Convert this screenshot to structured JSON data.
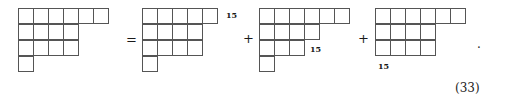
{
  "equation": {
    "number": "(33)",
    "terminal_punctuation": ".",
    "relation_symbol": "=",
    "plus_symbol_1": "+",
    "plus_symbol_2": "+",
    "added_cell_label_1": "15",
    "added_cell_label_2": "15",
    "added_cell_label_3": "15"
  },
  "diagrams": [
    {
      "name": "left-hand-side-diagram",
      "partition": [
        6,
        4,
        4,
        1
      ],
      "row_count": 4,
      "cell_total": 15
    },
    {
      "name": "first-term-diagram",
      "partition": [
        5,
        4,
        4,
        1
      ],
      "row_count": 4,
      "cell_total": 14,
      "added_cell_row": 1,
      "added_cell_label": "15"
    },
    {
      "name": "second-term-diagram",
      "partition": [
        6,
        4,
        3,
        1
      ],
      "row_count": 4,
      "cell_total": 14,
      "added_cell_row": 3,
      "added_cell_label": "15"
    },
    {
      "name": "third-term-diagram",
      "partition": [
        6,
        4,
        4
      ],
      "row_count": 3,
      "cell_total": 14,
      "added_cell_row": 3,
      "added_cell_label": "15"
    }
  ],
  "colors": {
    "grid_line": "#555555",
    "text": "#1a1a1a",
    "background": "#ffffff"
  }
}
